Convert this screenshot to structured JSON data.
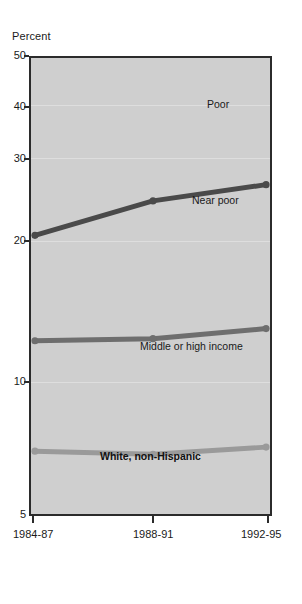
{
  "chart_data": {
    "type": "line",
    "title": "",
    "subtitle": "",
    "xlabel": "",
    "ylabel": "Percent",
    "categories": [
      "1984-87",
      "1988-91",
      "1992-95"
    ],
    "ylim": [
      5,
      50
    ],
    "yticks": [
      50,
      40,
      30,
      20,
      10,
      5
    ],
    "ytick_labels": [
      "50",
      "40",
      "30",
      "20",
      "10",
      "5"
    ],
    "grid": true,
    "legend_position": "inline-right",
    "annotation": "White, non-Hispanic",
    "series": [
      {
        "name": "Poor",
        "values": [
          32.5,
          35.9,
          37.5
        ],
        "color": "#4a4a4a"
      },
      {
        "name": "Near poor",
        "values": [
          22.1,
          22.3,
          23.3
        ],
        "color": "#6e6e6e"
      },
      {
        "name": "Middle or high income",
        "values": [
          11.2,
          10.9,
          11.6
        ],
        "color": "#9a9a9a"
      }
    ],
    "colors": {
      "plot_background": "#cfcfcf",
      "page_background": "#ffffff",
      "frame": "#2b2b2b",
      "gridline": "#dedede",
      "text": "#1a1a1a"
    }
  }
}
